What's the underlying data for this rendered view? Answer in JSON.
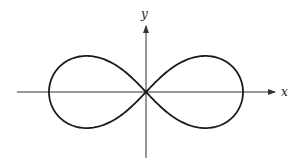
{
  "figure": {
    "type": "lemniscate",
    "x_axis_label": "x",
    "y_axis_label": "y",
    "colors": {
      "curve": "#1a1a1a",
      "axes": "#333333",
      "background": "#ffffff"
    }
  }
}
